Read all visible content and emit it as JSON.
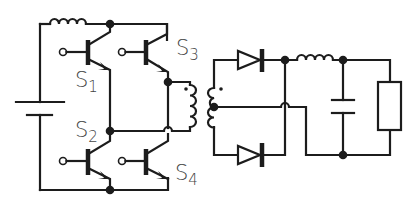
{
  "diagram": {
    "type": "circuit-schematic",
    "colors": {
      "line": "#1c1c1c",
      "label": "#444444",
      "background": "#ffffff"
    },
    "labels": {
      "s1": {
        "main": "S",
        "sub": "1"
      },
      "s2": {
        "main": "S",
        "sub": "2"
      },
      "s3": {
        "main": "S",
        "sub": "3"
      },
      "s4": {
        "main": "S",
        "sub": "4"
      }
    },
    "components": [
      {
        "id": "battery",
        "kind": "dc-source"
      },
      {
        "id": "input-inductor",
        "kind": "inductor"
      },
      {
        "id": "S1",
        "kind": "npn-transistor-switch"
      },
      {
        "id": "S2",
        "kind": "npn-transistor-switch"
      },
      {
        "id": "S3",
        "kind": "npn-transistor-switch"
      },
      {
        "id": "S4",
        "kind": "npn-transistor-switch"
      },
      {
        "id": "transformer",
        "kind": "center-tapped-transformer"
      },
      {
        "id": "D1",
        "kind": "diode"
      },
      {
        "id": "D2",
        "kind": "diode"
      },
      {
        "id": "output-inductor",
        "kind": "inductor"
      },
      {
        "id": "output-capacitor",
        "kind": "capacitor"
      },
      {
        "id": "load",
        "kind": "resistor"
      }
    ]
  }
}
